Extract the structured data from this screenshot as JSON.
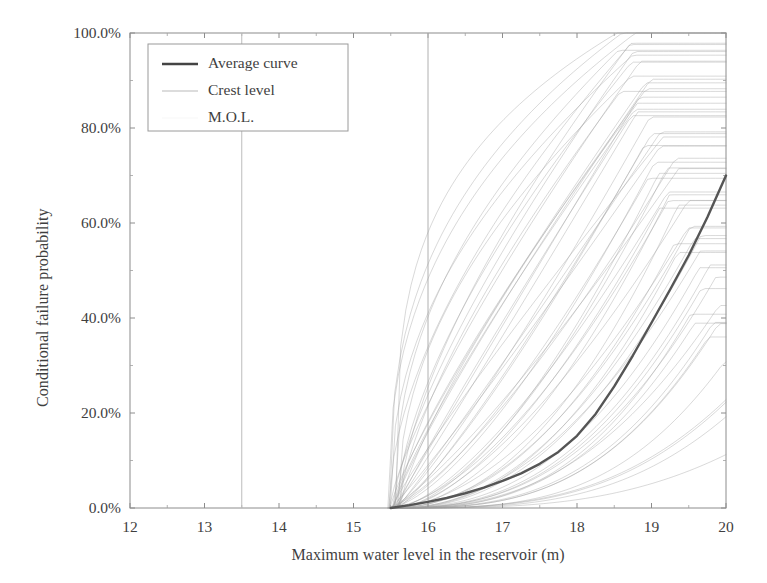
{
  "chart_data": {
    "type": "line",
    "title": "",
    "subtitle": "",
    "xlabel": "Maximum water level in the reservoir (m)",
    "ylabel": "Conditional failure probability",
    "xlim": [
      12,
      20
    ],
    "ylim": [
      0,
      1
    ],
    "xticks": [
      12,
      13,
      14,
      15,
      16,
      17,
      18,
      19,
      20
    ],
    "xticklabels": [
      "12",
      "13",
      "14",
      "15",
      "16",
      "17",
      "18",
      "19",
      "20"
    ],
    "yticks": [
      0,
      0.2,
      0.4,
      0.6,
      0.8,
      1.0
    ],
    "yticklabels": [
      "0.0%",
      "20.0%",
      "40.0%",
      "60.0%",
      "80.0%",
      "100.0%"
    ],
    "grid": false,
    "legend_position": "upper left",
    "legend": [
      {
        "label": "Average curve",
        "color": "#444444",
        "width": 2.4,
        "style": "solid"
      },
      {
        "label": "Crest level",
        "color": "#b9b9b9",
        "width": 1.0,
        "style": "solid"
      },
      {
        "label": "M.O.L.",
        "color": "#e2e2e2",
        "width": 0.8,
        "style": "solid"
      }
    ],
    "vlines": [
      {
        "name": "M.O.L.",
        "x": 13.5,
        "color": "#bdbdbd",
        "width": 1.0
      },
      {
        "name": "Crest level",
        "x": 16.0,
        "color": "#b0b0b0",
        "width": 1.0
      }
    ],
    "curve_onset_x": 15.5,
    "n_sample_curves": 60,
    "sample_curve_color": "#9a9a9a",
    "sample_curve_width": 0.7,
    "average_curve": {
      "name": "Average curve",
      "color": "#555555",
      "width": 2.4,
      "x": [
        15.5,
        15.75,
        16.0,
        16.25,
        16.5,
        16.75,
        17.0,
        17.25,
        17.5,
        17.75,
        18.0,
        18.25,
        18.5,
        18.75,
        19.0,
        19.25,
        19.5,
        19.75,
        20.0
      ],
      "y": [
        0.0,
        0.006,
        0.013,
        0.021,
        0.031,
        0.043,
        0.057,
        0.073,
        0.093,
        0.118,
        0.152,
        0.198,
        0.256,
        0.321,
        0.39,
        0.46,
        0.532,
        0.612,
        0.7
      ]
    },
    "sample_curves_spec": {
      "description": "Fan of ~60 conditional fragility curves rising from 0% near x=15.5 toward 100% between x=19 and x=20",
      "onset_min": 15.45,
      "onset_max": 15.62,
      "saturation_x_min": 18.6,
      "saturation_x_max": 20.0,
      "endpoint_y_min": 0.1,
      "endpoint_y_max": 1.0
    }
  },
  "axis": {
    "ylabel": "Conditional failure probability",
    "xlabel": "Maximum water level in the reservoir (m)"
  }
}
